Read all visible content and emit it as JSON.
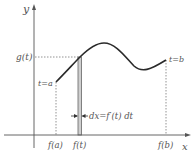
{
  "diagram": {
    "axes": {
      "y_label": "y",
      "x_label": "x"
    },
    "labels": {
      "g_t": "g(t)",
      "t_a": "t=a",
      "t_b": "t=b",
      "f_a": "f(a)",
      "f_t": "f(t)",
      "f_b": "f(b)",
      "dx": "dx=f′(t) dt"
    },
    "colors": {
      "curve": "#2a2a2a",
      "axis": "#555555",
      "strip": "#8a8a8a",
      "dotted": "#777777"
    }
  }
}
